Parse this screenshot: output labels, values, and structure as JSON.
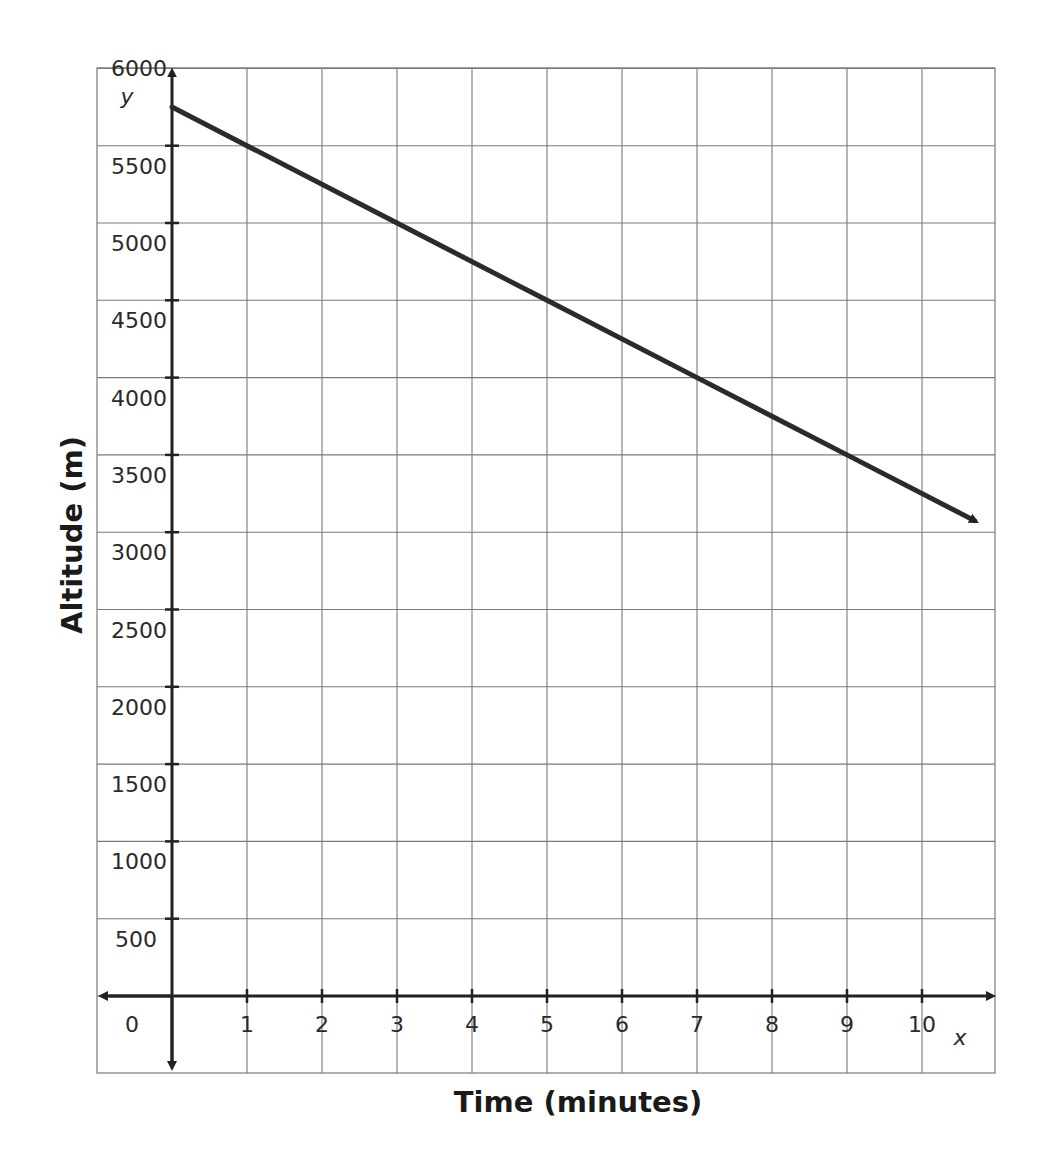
{
  "chart_data": {
    "type": "line",
    "title": "",
    "xlabel": "Time (minutes)",
    "ylabel": "Altitude (m)",
    "x_axis_var": "x",
    "y_axis_var": "y",
    "xlim": [
      0,
      11
    ],
    "ylim": [
      0,
      6000
    ],
    "grid": true,
    "legend": null,
    "x_ticks": [
      0,
      1,
      2,
      3,
      4,
      5,
      6,
      7,
      8,
      9,
      10
    ],
    "x_tick_labels": [
      "0",
      "1",
      "2",
      "3",
      "4",
      "5",
      "6",
      "7",
      "8",
      "9",
      "10"
    ],
    "y_ticks": [
      500,
      1000,
      1500,
      2000,
      2500,
      3000,
      3500,
      4000,
      4500,
      5000,
      5500,
      6000
    ],
    "y_tick_labels": [
      "500",
      "1000",
      "1500",
      "2000",
      "2500",
      "3000",
      "3500",
      "4000",
      "4500",
      "5000",
      "5500",
      "6000"
    ],
    "series": [
      {
        "name": "Altitude",
        "x": [
          0,
          1,
          3,
          5,
          7,
          9,
          10.7
        ],
        "y": [
          5750,
          5500,
          5000,
          4500,
          4000,
          3500,
          3075
        ],
        "equation": "y = 5750 - 250x",
        "end_arrow": true,
        "color": "#2b2b2b"
      }
    ]
  },
  "colors": {
    "grid": "#7a7a7a",
    "axis": "#222222",
    "line": "#2b2b2b"
  }
}
